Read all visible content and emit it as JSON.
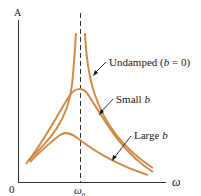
{
  "figure": {
    "y_axis_label": "A",
    "x_axis_label": "ω",
    "origin_label": "0",
    "resonance_tick_label": "ω",
    "resonance_tick_subscript": "0",
    "colors": {
      "curve": "#d08a47",
      "axis": "#333333",
      "dashed_line": "#333333",
      "text": "#1a1a1a"
    },
    "curves": [
      {
        "name": "undamped",
        "label_prefix": "Undamped (",
        "label_var": "b",
        "label_suffix": " = 0)"
      },
      {
        "name": "small-b",
        "label_prefix": "Small ",
        "label_var": "b",
        "label_suffix": ""
      },
      {
        "name": "large-b",
        "label_prefix": "Large ",
        "label_var": "b",
        "label_suffix": ""
      }
    ]
  }
}
